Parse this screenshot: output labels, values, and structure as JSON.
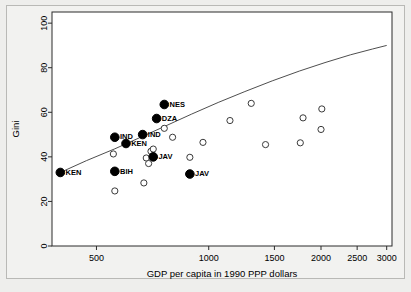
{
  "chart_data": {
    "type": "scatter",
    "title": "",
    "xlabel": "GDP per capita in 1990 PPP dollars",
    "ylabel": "Gini",
    "xscale": "log",
    "xlim": [
      380,
      3100
    ],
    "ylim": [
      0,
      105
    ],
    "xticks": [
      500,
      1000,
      1500,
      2000,
      2500,
      3000
    ],
    "xtick_labels": [
      "500",
      "1000",
      "1500",
      "2000",
      "2500",
      "3000"
    ],
    "yticks": [
      0,
      20,
      40,
      60,
      80,
      100
    ],
    "ytick_labels": [
      "0",
      "20",
      "40",
      "60",
      "80",
      "100"
    ],
    "grid": false,
    "legend": "none",
    "series": [
      {
        "name": "labelled-filled",
        "marker": "filled-circle",
        "color": "#000000",
        "points": [
          {
            "x": 400,
            "y": 33.0,
            "label": "KEN",
            "label_side": "right"
          },
          {
            "x": 560,
            "y": 33.5,
            "label": "BIH",
            "label_side": "right"
          },
          {
            "x": 560,
            "y": 48.8,
            "label": "IND",
            "label_side": "right"
          },
          {
            "x": 600,
            "y": 46.0,
            "label": "KEN",
            "label_side": "right"
          },
          {
            "x": 665,
            "y": 50.0,
            "label": "IND",
            "label_side": "right"
          },
          {
            "x": 710,
            "y": 40.0,
            "label": "JAV",
            "label_side": "right"
          },
          {
            "x": 725,
            "y": 57.2,
            "label": "DZA",
            "label_side": "right"
          },
          {
            "x": 760,
            "y": 63.5,
            "label": "NES",
            "label_side": "right"
          },
          {
            "x": 890,
            "y": 32.3,
            "label": "JAV",
            "label_side": "right"
          }
        ]
      },
      {
        "name": "unlabelled-open",
        "marker": "open-circle",
        "color": "#3a3a3a",
        "points": [
          {
            "x": 555,
            "y": 41.3
          },
          {
            "x": 560,
            "y": 24.7
          },
          {
            "x": 670,
            "y": 28.3
          },
          {
            "x": 680,
            "y": 39.5
          },
          {
            "x": 690,
            "y": 37.0
          },
          {
            "x": 700,
            "y": 42.5
          },
          {
            "x": 710,
            "y": 43.5
          },
          {
            "x": 760,
            "y": 52.8
          },
          {
            "x": 800,
            "y": 48.8
          },
          {
            "x": 890,
            "y": 39.8
          },
          {
            "x": 965,
            "y": 46.5
          },
          {
            "x": 1140,
            "y": 56.3
          },
          {
            "x": 1300,
            "y": 64.0
          },
          {
            "x": 1420,
            "y": 45.5
          },
          {
            "x": 1760,
            "y": 46.3
          },
          {
            "x": 1790,
            "y": 57.5
          },
          {
            "x": 2010,
            "y": 61.5
          },
          {
            "x": 2000,
            "y": 52.3
          }
        ]
      }
    ],
    "fit_curve": {
      "name": "fitted-trend-line",
      "color": "#3a3a3a",
      "points": [
        {
          "x": 400,
          "y": 33.0
        },
        {
          "x": 470,
          "y": 38.3
        },
        {
          "x": 560,
          "y": 43.6
        },
        {
          "x": 665,
          "y": 49.2
        },
        {
          "x": 760,
          "y": 53.6
        },
        {
          "x": 900,
          "y": 59.2
        },
        {
          "x": 1060,
          "y": 64.4
        },
        {
          "x": 1250,
          "y": 69.3
        },
        {
          "x": 1480,
          "y": 74.1
        },
        {
          "x": 1750,
          "y": 78.5
        },
        {
          "x": 2050,
          "y": 82.3
        },
        {
          "x": 2400,
          "y": 85.8
        },
        {
          "x": 2750,
          "y": 88.4
        },
        {
          "x": 3000,
          "y": 90.0
        }
      ]
    }
  }
}
